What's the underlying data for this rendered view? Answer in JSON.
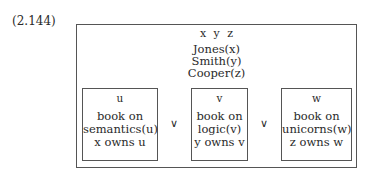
{
  "equation_label": "(2.144)",
  "drs": {
    "universe": "x y z",
    "conditions": [
      "Jones(x)",
      "Smith(y)",
      "Cooper(z)"
    ],
    "disjunction_operator": "∨",
    "disjuncts": [
      {
        "referent": "u",
        "conditions": [
          "book on",
          "semantics(u)",
          "x owns u"
        ]
      },
      {
        "referent": "v",
        "conditions": [
          "book on",
          "logic(v)",
          "y owns v"
        ]
      },
      {
        "referent": "w",
        "conditions": [
          "book on",
          "unicorns(w)",
          "z owns w"
        ]
      }
    ]
  }
}
